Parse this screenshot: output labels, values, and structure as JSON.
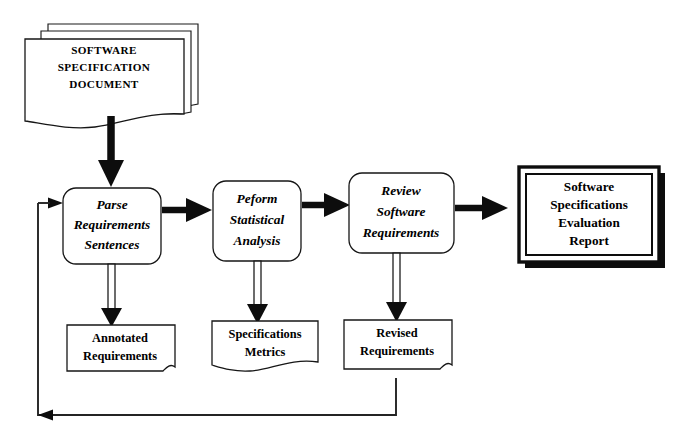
{
  "diagram": {
    "type": "flowchart",
    "background_color": "#ffffff",
    "line_color": "#0d0d0d",
    "input_document": {
      "id": "software-specification-document",
      "shape": "stacked-document",
      "stack_count": 3,
      "lines": [
        "SOFTWARE",
        "SPECIFICATION",
        "DOCUMENT"
      ]
    },
    "processes": [
      {
        "id": "parse-requirements-sentences",
        "shape": "rounded-rectangle",
        "lines": [
          "Parse",
          "Requirements",
          "Sentences"
        ]
      },
      {
        "id": "peform-statistical-analysis",
        "shape": "rounded-rectangle",
        "lines": [
          "Peform",
          "Statistical",
          "Analysis"
        ]
      },
      {
        "id": "review-software-requirements",
        "shape": "rounded-rectangle",
        "lines": [
          "Review",
          "Software",
          "Requirements"
        ]
      }
    ],
    "data_stores": [
      {
        "id": "annotated-requirements",
        "shape": "document",
        "lines": [
          "Annotated",
          "Requirements"
        ]
      },
      {
        "id": "specifications-metrics",
        "shape": "document",
        "lines": [
          "Specifications",
          "Metrics"
        ]
      },
      {
        "id": "revised-requirements",
        "shape": "document",
        "lines": [
          "Revised",
          "Requirements"
        ]
      }
    ],
    "output_report": {
      "id": "software-specifications-evaluation-report",
      "shape": "double-bordered-box-with-shadow",
      "lines": [
        "Software",
        "Specifications",
        "Evaluation",
        "Report"
      ]
    },
    "connectors": [
      {
        "id": "doc-to-parse",
        "from": "software-specification-document",
        "to": "parse-requirements-sentences",
        "style": "thick-solid-arrow",
        "direction": "down"
      },
      {
        "id": "parse-to-peform",
        "from": "parse-requirements-sentences",
        "to": "peform-statistical-analysis",
        "style": "thick-solid-arrow",
        "direction": "right"
      },
      {
        "id": "peform-to-review",
        "from": "peform-statistical-analysis",
        "to": "review-software-requirements",
        "style": "thick-solid-arrow",
        "direction": "right"
      },
      {
        "id": "review-to-report",
        "from": "review-software-requirements",
        "to": "software-specifications-evaluation-report",
        "style": "thick-solid-arrow",
        "direction": "right"
      },
      {
        "id": "parse-to-annotated",
        "from": "parse-requirements-sentences",
        "to": "annotated-requirements",
        "style": "hollow-double-line-arrow",
        "direction": "down"
      },
      {
        "id": "peform-to-metrics",
        "from": "peform-statistical-analysis",
        "to": "specifications-metrics",
        "style": "hollow-double-line-arrow",
        "direction": "down"
      },
      {
        "id": "review-to-revised",
        "from": "review-software-requirements",
        "to": "revised-requirements",
        "style": "hollow-double-line-arrow",
        "direction": "down"
      },
      {
        "id": "feedback-loop",
        "from": "revised-requirements",
        "to": "parse-requirements-sentences",
        "style": "thin-line-arrow",
        "direction": "down-left-up"
      }
    ]
  }
}
